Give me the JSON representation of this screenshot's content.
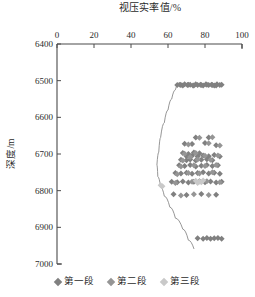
{
  "chart_data": {
    "type": "scatter",
    "title": "视压实率值/%",
    "xlabel": "视压实率值/%",
    "ylabel": "深度/m",
    "xlim": [
      0,
      100
    ],
    "ylim": [
      7000,
      6400
    ],
    "y_inverted": true,
    "x_axis_position": "top",
    "grid": false,
    "legend_position": "bottom",
    "xticks": [
      0,
      20,
      40,
      60,
      80,
      100
    ],
    "xtick_labels": [
      "0",
      "20",
      "40",
      "60",
      "80",
      "100"
    ],
    "yticks": [
      6400,
      6500,
      6600,
      6700,
      6800,
      6900,
      7000
    ],
    "ytick_labels": [
      "6400",
      "6500",
      "6600",
      "6700",
      "6800",
      "6900",
      "7000"
    ],
    "series": [
      {
        "name": "第一段",
        "color": "#808080",
        "marker": "diamond",
        "points": [
          [
            65,
            6512
          ],
          [
            66.5,
            6511
          ],
          [
            68,
            6513
          ],
          [
            69,
            6510
          ],
          [
            70.5,
            6512
          ],
          [
            72,
            6511
          ],
          [
            73.5,
            6513
          ],
          [
            75,
            6510
          ],
          [
            76,
            6512
          ],
          [
            77.5,
            6511
          ],
          [
            79,
            6513
          ],
          [
            80.5,
            6510
          ],
          [
            82,
            6512
          ],
          [
            83.5,
            6511
          ],
          [
            85,
            6513
          ],
          [
            86.5,
            6510
          ],
          [
            88,
            6512
          ],
          [
            89,
            6511
          ],
          [
            86,
            6513
          ],
          [
            78,
            6512
          ],
          [
            71,
            6511
          ],
          [
            67,
            6512
          ],
          [
            74,
            6513
          ],
          [
            81,
            6511
          ],
          [
            84,
            6512
          ],
          [
            75,
            6655
          ],
          [
            82,
            6655
          ],
          [
            69,
            6672
          ],
          [
            73,
            6673
          ],
          [
            80,
            6670
          ],
          [
            86,
            6676
          ],
          [
            68,
            6697
          ],
          [
            71,
            6700
          ],
          [
            74,
            6696
          ],
          [
            77,
            6698
          ],
          [
            70,
            6706
          ],
          [
            73,
            6705
          ],
          [
            76,
            6707
          ],
          [
            79,
            6704
          ],
          [
            82,
            6706
          ],
          [
            85,
            6703
          ],
          [
            88,
            6707
          ],
          [
            67,
            6716
          ],
          [
            70,
            6717
          ],
          [
            72,
            6715
          ],
          [
            75,
            6718
          ],
          [
            78,
            6716
          ],
          [
            81,
            6714
          ],
          [
            84,
            6717
          ],
          [
            66,
            6731
          ],
          [
            69,
            6733
          ],
          [
            72,
            6730
          ],
          [
            75,
            6734
          ],
          [
            78,
            6732
          ],
          [
            81,
            6730
          ],
          [
            84,
            6733
          ],
          [
            87,
            6731
          ],
          [
            64,
            6752
          ],
          [
            67,
            6753
          ],
          [
            70,
            6751
          ],
          [
            73,
            6754
          ],
          [
            76,
            6752
          ],
          [
            79,
            6750
          ],
          [
            82,
            6753
          ],
          [
            85,
            6751
          ],
          [
            88,
            6754
          ],
          [
            62,
            6776
          ],
          [
            65,
            6777
          ],
          [
            68,
            6775
          ],
          [
            71,
            6778
          ],
          [
            74,
            6776
          ],
          [
            77,
            6774
          ],
          [
            80,
            6777
          ],
          [
            83,
            6775
          ],
          [
            86,
            6778
          ],
          [
            89,
            6776
          ],
          [
            63,
            6810
          ],
          [
            70,
            6812
          ],
          [
            78,
            6809
          ],
          [
            86,
            6811
          ],
          [
            76,
            6930
          ],
          [
            79,
            6931
          ],
          [
            81,
            6929
          ],
          [
            83,
            6931
          ],
          [
            85,
            6930
          ],
          [
            87,
            6929
          ],
          [
            89,
            6931
          ]
        ]
      },
      {
        "name": "第二段",
        "color": "#959595",
        "marker": "diamond",
        "points": [
          [
            77,
            6656
          ],
          [
            84,
            6654
          ],
          [
            71,
            6674
          ],
          [
            82,
            6671
          ],
          [
            88,
            6677
          ],
          [
            69,
            6699
          ],
          [
            75,
            6697
          ],
          [
            72,
            6708
          ],
          [
            80,
            6705
          ],
          [
            87,
            6704
          ],
          [
            68,
            6718
          ],
          [
            76,
            6715
          ],
          [
            83,
            6716
          ],
          [
            67,
            6734
          ],
          [
            74,
            6731
          ],
          [
            80,
            6733
          ],
          [
            86,
            6730
          ],
          [
            65,
            6755
          ],
          [
            71,
            6752
          ],
          [
            77,
            6753
          ],
          [
            84,
            6750
          ],
          [
            64,
            6779
          ],
          [
            73,
            6776
          ],
          [
            81,
            6774
          ],
          [
            88,
            6777
          ],
          [
            67,
            6813
          ],
          [
            74,
            6810
          ],
          [
            82,
            6812
          ]
        ]
      },
      {
        "name": "第三段",
        "color": "#c9c9c9",
        "marker": "diamond",
        "points": [
          [
            75,
            6773
          ],
          [
            77,
            6775
          ],
          [
            79,
            6772
          ],
          [
            76,
            6779
          ],
          [
            78,
            6777
          ],
          [
            56,
            6785
          ],
          [
            57,
            6788
          ]
        ]
      }
    ],
    "boundary_curve": {
      "name": "compaction-boundary",
      "color": "#8a8a8a",
      "points": [
        [
          66,
          6505
        ],
        [
          64,
          6525
        ],
        [
          62,
          6550
        ],
        [
          60,
          6580
        ],
        [
          58,
          6615
        ],
        [
          56,
          6655
        ],
        [
          55,
          6695
        ],
        [
          54,
          6730
        ],
        [
          54.5,
          6762
        ],
        [
          56,
          6790
        ],
        [
          58,
          6815
        ],
        [
          61,
          6845
        ],
        [
          64,
          6875
        ],
        [
          68,
          6905
        ],
        [
          71,
          6935
        ],
        [
          74,
          6958
        ]
      ]
    }
  },
  "legend": {
    "entries": [
      {
        "label": "第一段",
        "color": "#808080"
      },
      {
        "label": "第二段",
        "color": "#959595"
      },
      {
        "label": "第三段",
        "color": "#c9c9c9"
      }
    ]
  },
  "axes": {
    "title": "视压实率值/%",
    "ylabel": "深度/m"
  }
}
